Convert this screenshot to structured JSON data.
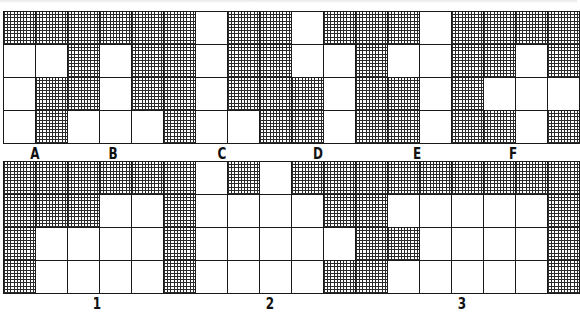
{
  "puzzle": {
    "top_grid": {
      "columns": 18,
      "rows": [
        [
          1,
          1,
          1,
          1,
          1,
          1,
          0,
          1,
          1,
          0,
          1,
          1,
          1,
          0,
          1,
          1,
          1,
          1
        ],
        [
          0,
          0,
          1,
          0,
          1,
          1,
          0,
          1,
          1,
          0,
          0,
          1,
          0,
          0,
          1,
          1,
          0,
          1
        ],
        [
          0,
          1,
          1,
          0,
          1,
          1,
          0,
          1,
          1,
          1,
          0,
          1,
          1,
          0,
          1,
          0,
          0,
          0
        ],
        [
          0,
          1,
          0,
          0,
          0,
          1,
          0,
          0,
          1,
          1,
          0,
          1,
          1,
          0,
          1,
          1,
          0,
          1
        ]
      ],
      "labels": [
        {
          "text": "A",
          "x": 35
        },
        {
          "text": "B",
          "x": 113
        },
        {
          "text": "C",
          "x": 222
        },
        {
          "text": "D",
          "x": 318
        },
        {
          "text": "E",
          "x": 417
        },
        {
          "text": "F",
          "x": 513
        }
      ]
    },
    "bottom_grid": {
      "columns": 18,
      "rows": [
        [
          1,
          1,
          1,
          1,
          1,
          1,
          0,
          1,
          0,
          1,
          1,
          1,
          1,
          1,
          1,
          1,
          1,
          1
        ],
        [
          1,
          1,
          1,
          0,
          0,
          1,
          0,
          0,
          0,
          0,
          1,
          1,
          0,
          0,
          0,
          0,
          0,
          1
        ],
        [
          1,
          0,
          0,
          0,
          0,
          1,
          0,
          0,
          0,
          0,
          0,
          1,
          1,
          0,
          0,
          0,
          0,
          1
        ],
        [
          1,
          0,
          0,
          0,
          0,
          1,
          0,
          0,
          0,
          0,
          1,
          1,
          0,
          0,
          0,
          0,
          0,
          1
        ]
      ],
      "labels": [
        {
          "text": "1",
          "x": 97
        },
        {
          "text": "2",
          "x": 270
        },
        {
          "text": "3",
          "x": 462
        }
      ]
    },
    "colors": {
      "hatch": "#2a2a2a",
      "line": "#1a1a1a",
      "background": "#ffffff"
    }
  }
}
